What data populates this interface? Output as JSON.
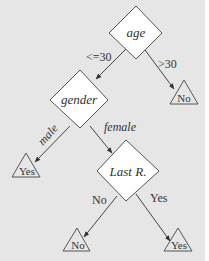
{
  "diagram": {
    "type": "decision-tree",
    "colors": {
      "background": "#e6e6e6",
      "node_fill": "#ffffff",
      "stroke": "#555555",
      "text": "#333333"
    },
    "nodes": {
      "age": {
        "label": "age",
        "shape": "diamond"
      },
      "gender": {
        "label": "gender",
        "shape": "diamond"
      },
      "last_r": {
        "label": "Last R.",
        "shape": "diamond"
      },
      "leaf_age_gt30": {
        "label": "No",
        "shape": "triangle"
      },
      "leaf_male": {
        "label": "Yes",
        "shape": "triangle"
      },
      "leaf_lastr_no": {
        "label": "No",
        "shape": "triangle"
      },
      "leaf_lastr_yes": {
        "label": "Yes",
        "shape": "triangle"
      }
    },
    "edges": {
      "age_le30": {
        "label": "<=30",
        "from": "age",
        "to": "gender"
      },
      "age_gt30": {
        "label": ">30",
        "from": "age",
        "to": "leaf_age_gt30"
      },
      "gender_male": {
        "label": "male",
        "from": "gender",
        "to": "leaf_male"
      },
      "gender_female": {
        "label": "female",
        "from": "gender",
        "to": "last_r"
      },
      "lastr_no": {
        "label": "No",
        "from": "last_r",
        "to": "leaf_lastr_no"
      },
      "lastr_yes": {
        "label": "Yes",
        "from": "last_r",
        "to": "leaf_lastr_yes"
      }
    }
  }
}
